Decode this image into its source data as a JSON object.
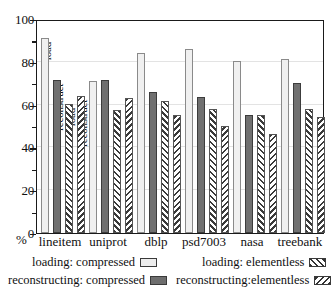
{
  "chart_data": {
    "type": "bar",
    "title": "",
    "xlabel": "",
    "ylabel": "%",
    "ylim": [
      0,
      100
    ],
    "ytick_step": 20,
    "yticks": [
      0,
      20,
      40,
      60,
      80,
      100
    ],
    "ytick_labels": [
      "0",
      "20",
      "40",
      "60",
      "80",
      "100"
    ],
    "minor_ytick_step": 10,
    "grid": true,
    "legend_position": "below-plot",
    "categories": [
      "lineitem",
      "uniprot",
      "dblp",
      "psd7003",
      "nasa",
      "treebank"
    ],
    "series": [
      {
        "name": "loading: compressed",
        "fill": "solid-light",
        "values": [
          91,
          71,
          84,
          86,
          80.5,
          81.5
        ]
      },
      {
        "name": "reconstructing: compressed",
        "fill": "solid-dark",
        "values": [
          71.5,
          71.5,
          66,
          63.5,
          55,
          70
        ]
      },
      {
        "name": "loading: elementless",
        "fill": "hatch-backslash",
        "values": [
          60.5,
          57.5,
          61.5,
          58,
          55,
          58
        ]
      },
      {
        "name": "reconstructing:elementless",
        "fill": "hatch-slash",
        "values": [
          64,
          63,
          55,
          50,
          46.5,
          54
        ]
      }
    ],
    "bar_annotations": [
      {
        "group": "lineitem",
        "series": "loading: compressed",
        "text": "load"
      },
      {
        "group": "lineitem",
        "series": "reconstructing: compressed",
        "text": "reconstruct"
      },
      {
        "group": "lineitem",
        "series": "loading: elementless",
        "text": "load"
      },
      {
        "group": "lineitem",
        "series": "reconstructing:elementless",
        "text": "reconstruct"
      }
    ]
  },
  "legend": {
    "items": [
      {
        "label": "loading: compressed",
        "swatch": "solid-light"
      },
      {
        "label": "loading: elementless",
        "swatch": "hatch-backslash"
      },
      {
        "label": "reconstructing: compressed",
        "swatch": "solid-dark"
      },
      {
        "label": "reconstructing:elementless",
        "swatch": "hatch-slash"
      }
    ]
  },
  "colors": {
    "axis": "#1a1a1a",
    "grid": "#e3e3e3",
    "series_light": "#f0f0f0",
    "series_dark": "#707070",
    "hatch": "#3a3a3a",
    "background": "#ffffff"
  }
}
